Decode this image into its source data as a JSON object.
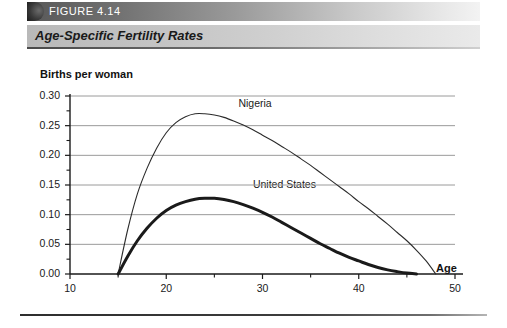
{
  "figure": {
    "badge_label": "FIGURE 4.14",
    "title": "Age-Specific Fertility Rates"
  },
  "chart_data": {
    "type": "line",
    "title": "Age-Specific Fertility Rates",
    "xlabel": "Age",
    "ylabel": "Births per woman",
    "xlim": [
      10,
      50
    ],
    "ylim": [
      0.0,
      0.3
    ],
    "xticks": [
      "10",
      "20",
      "30",
      "40",
      "50"
    ],
    "xtick_values": [
      10,
      20,
      30,
      40,
      50
    ],
    "yticks": [
      "0.00",
      "0.05",
      "0.10",
      "0.15",
      "0.20",
      "0.25",
      "0.30"
    ],
    "ytick_values": [
      0.0,
      0.05,
      0.1,
      0.15,
      0.2,
      0.25,
      0.3
    ],
    "minor_ticks": true,
    "grid": "horizontal",
    "grid_color": "#9a9a9a",
    "legend": "inline-labels",
    "series": [
      {
        "name": "Nigeria",
        "label_x": 27.5,
        "label_y": 0.285,
        "line_width": 1.1,
        "color": "#2b2b2b",
        "x": [
          15,
          16,
          17,
          18,
          19,
          20,
          21,
          22,
          23,
          24,
          25,
          26,
          27,
          28,
          29,
          30,
          31,
          32,
          33,
          34,
          35,
          36,
          37,
          38,
          39,
          40,
          41,
          42,
          43,
          44,
          45,
          46,
          47,
          48
        ],
        "values": [
          0.0,
          0.075,
          0.135,
          0.178,
          0.212,
          0.238,
          0.255,
          0.265,
          0.27,
          0.27,
          0.268,
          0.264,
          0.258,
          0.251,
          0.243,
          0.234,
          0.225,
          0.215,
          0.205,
          0.194,
          0.183,
          0.171,
          0.159,
          0.147,
          0.135,
          0.122,
          0.11,
          0.097,
          0.084,
          0.07,
          0.056,
          0.04,
          0.022,
          0.0
        ]
      },
      {
        "name": "United States",
        "label_x": 29.0,
        "label_y": 0.148,
        "line_width": 3.0,
        "color": "#1a1a1a",
        "x": [
          15,
          16,
          17,
          18,
          19,
          20,
          21,
          22,
          23,
          24,
          25,
          26,
          27,
          28,
          29,
          30,
          31,
          32,
          33,
          34,
          35,
          36,
          37,
          38,
          39,
          40,
          41,
          42,
          43,
          44,
          45,
          46
        ],
        "values": [
          0.0,
          0.03,
          0.056,
          0.077,
          0.094,
          0.107,
          0.116,
          0.122,
          0.126,
          0.1275,
          0.1275,
          0.1255,
          0.122,
          0.117,
          0.111,
          0.104,
          0.096,
          0.087,
          0.078,
          0.069,
          0.06,
          0.051,
          0.043,
          0.035,
          0.028,
          0.022,
          0.016,
          0.011,
          0.007,
          0.004,
          0.0015,
          0.0
        ]
      }
    ]
  }
}
